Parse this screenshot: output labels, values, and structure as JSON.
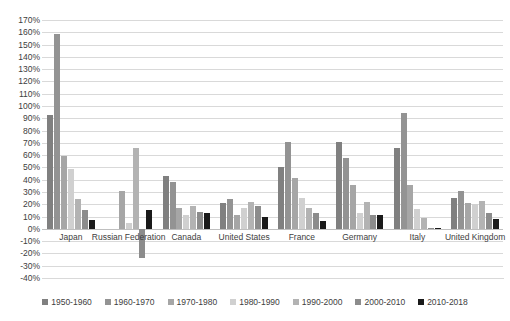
{
  "chart_data": {
    "type": "bar",
    "title": "",
    "xlabel": "",
    "ylabel": "",
    "ylim": [
      -40,
      170
    ],
    "ytick_step": 10,
    "grid": true,
    "legend_position": "bottom",
    "ytick_labels": [
      "170%",
      "160%",
      "150%",
      "140%",
      "130%",
      "120%",
      "110%",
      "100%",
      "90%",
      "80%",
      "70%",
      "60%",
      "50%",
      "40%",
      "30%",
      "20%",
      "10%",
      "0%",
      "-10%",
      "-20%",
      "-30%",
      "-40%"
    ],
    "categories": [
      "Japan",
      "Russian Federation",
      "Canada",
      "United States",
      "France",
      "Germany",
      "Italy",
      "United Kingdom"
    ],
    "series": [
      {
        "name": "1950-1960",
        "color": "#808080",
        "values": [
          93,
          null,
          43,
          21,
          50,
          71,
          66,
          25
        ]
      },
      {
        "name": "1960-1970",
        "color": "#939393",
        "values": [
          159,
          null,
          38,
          24,
          71,
          58,
          94,
          31
        ]
      },
      {
        "name": "1970-1980",
        "color": "#a6a6a6",
        "values": [
          59,
          31,
          17,
          11,
          41,
          36,
          36,
          21
        ]
      },
      {
        "name": "1980-1990",
        "color": "#d0d0d0",
        "values": [
          49,
          5,
          11,
          17,
          25,
          13,
          16,
          20
        ]
      },
      {
        "name": "1990-2000",
        "color": "#b3b3b3",
        "values": [
          24,
          66,
          19,
          22,
          17,
          22,
          9,
          23
        ]
      },
      {
        "name": "2000-2010",
        "color": "#8c8c8c",
        "values": [
          15,
          -24,
          14,
          19,
          13,
          11,
          1,
          13
        ]
      },
      {
        "name": "2010-2018",
        "color": "#1a1a1a",
        "values": [
          7,
          15,
          13,
          10,
          6,
          11,
          1,
          8
        ]
      }
    ]
  }
}
